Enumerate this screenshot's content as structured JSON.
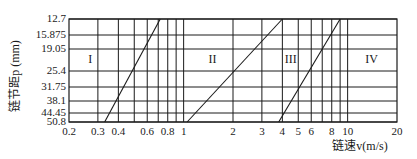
{
  "chart_data": {
    "type": "line",
    "title": "",
    "xlabel": "链速v(m/s)",
    "ylabel": "链节距p (mm)",
    "x_scale": "log",
    "xlim": [
      0.2,
      20
    ],
    "x_ticks": [
      0.2,
      0.3,
      0.4,
      0.6,
      0.8,
      1,
      2,
      3,
      4,
      5,
      6,
      8,
      10,
      20
    ],
    "x_tick_labels": [
      "0.2",
      "0.3",
      "0.4",
      "0.6",
      "0.8",
      "1",
      "2",
      "3",
      "4",
      "5",
      "6",
      "8",
      "10",
      "20"
    ],
    "x_gridlines": [
      0.3,
      0.4,
      0.5,
      0.6,
      0.7,
      0.8,
      0.9,
      1,
      2,
      3,
      4,
      5,
      6,
      7,
      8,
      9,
      10
    ],
    "y_ticks": [
      12.7,
      15.875,
      19.05,
      25.4,
      31.75,
      38.1,
      44.45,
      50.8
    ],
    "y_tick_labels": [
      "12.7",
      "15.875",
      "19.05",
      "25.4",
      "31.75",
      "38.1",
      "44.45",
      "50.8"
    ],
    "y_direction": "top-to-bottom increasing",
    "grid": true,
    "regions": [
      {
        "label": "I",
        "x": 0.27,
        "y": 22
      },
      {
        "label": "II",
        "x": 1.5,
        "y": 22
      },
      {
        "label": "III",
        "x": 4.5,
        "y": 22
      },
      {
        "label": "IV",
        "x": 14,
        "y": 22
      }
    ],
    "series": [
      {
        "name": "I/II boundary",
        "points": [
          [
            0.33,
            50.8
          ],
          [
            0.72,
            12.7
          ]
        ]
      },
      {
        "name": "II/III boundary",
        "points": [
          [
            1.05,
            50.8
          ],
          [
            4.0,
            12.7
          ]
        ]
      },
      {
        "name": "III/IV boundary",
        "points": [
          [
            3.8,
            50.8
          ],
          [
            9.0,
            12.7
          ]
        ]
      }
    ]
  },
  "colors": {
    "line": "#1a1a1a",
    "background": "#ffffff"
  }
}
